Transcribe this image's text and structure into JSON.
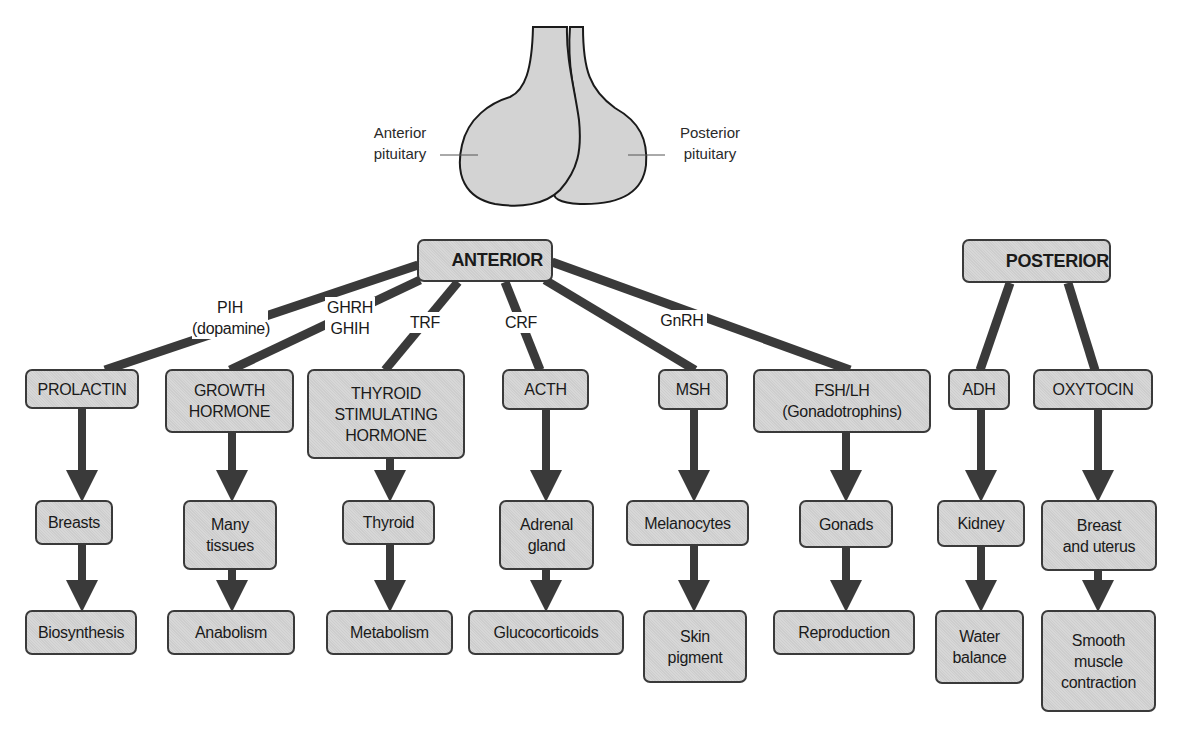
{
  "pituitary": {
    "anterior_label": "Anterior\npituitary",
    "posterior_label": "Posterior\npituitary",
    "fill_color": "#d3d3d3",
    "outline_color": "#1a1a1a"
  },
  "anterior": {
    "title": "ANTERIOR",
    "releasing_factors": [
      {
        "label": "PIH\n(dopamine)",
        "target": "PROLACTIN"
      },
      {
        "label": "GHRH\nGHIH",
        "target": "GROWTH HORMONE"
      },
      {
        "label": "TRF",
        "target": "THYROID STIMULATING HORMONE"
      },
      {
        "label": "CRF",
        "target": "ACTH"
      },
      {
        "label": "",
        "target": "MSH"
      },
      {
        "label": "GnRH",
        "target": "FSH/LH"
      }
    ],
    "hormones": [
      {
        "name": "PROLACTIN",
        "target": "Breasts",
        "effect": "Biosynthesis"
      },
      {
        "name": "GROWTH\nHORMONE",
        "target": "Many\ntissues",
        "effect": "Anabolism"
      },
      {
        "name": "THYROID\nSTIMULATING\nHORMONE",
        "target": "Thyroid",
        "effect": "Metabolism"
      },
      {
        "name": "ACTH",
        "target": "Adrenal\ngland",
        "effect": "Glucocorticoids"
      },
      {
        "name": "MSH",
        "target": "Melanocytes",
        "effect": "Skin\npigment"
      },
      {
        "name": "FSH/LH\n(Gonadotrophins)",
        "target": "Gonads",
        "effect": "Reproduction"
      }
    ]
  },
  "posterior": {
    "title": "POSTERIOR",
    "hormones": [
      {
        "name": "ADH",
        "target": "Kidney",
        "effect": "Water\nbalance"
      },
      {
        "name": "OXYTOCIN",
        "target": "Breast\nand uterus",
        "effect": "Smooth\nmuscle\ncontraction"
      }
    ]
  },
  "colors": {
    "box_fill": "#d4d4d4",
    "box_border": "#3a3a3a",
    "connector": "#3a3a3a",
    "background": "#ffffff"
  }
}
